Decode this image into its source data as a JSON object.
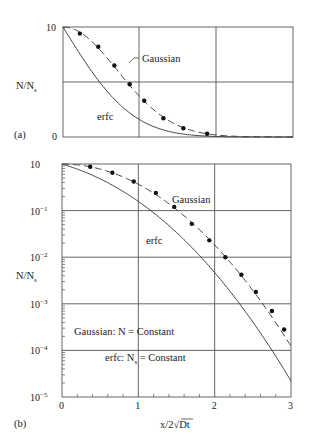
{
  "figure": {
    "panel_a_label": "(a)",
    "panel_b_label": "(b)"
  },
  "chart_data": [
    {
      "panel": "(a)",
      "type": "line",
      "scale": "linear",
      "xlabel": "",
      "ylabel": "N/N_s",
      "ylabel_main": "N/N",
      "ylabel_sub": "s",
      "ytick_labels": [
        "10",
        "0"
      ],
      "xlim": [
        0,
        3
      ],
      "ylim": [
        0,
        1
      ],
      "grid": true,
      "annotations": [
        "Gaussian",
        "erfc"
      ],
      "series": [
        {
          "name": "Gaussian",
          "style": "dashed with dots",
          "x": [
            0.22,
            0.46,
            0.67,
            0.87,
            1.06,
            1.31,
            1.57,
            1.88
          ],
          "values": [
            0.94,
            0.82,
            0.65,
            0.48,
            0.33,
            0.17,
            0.08,
            0.03
          ]
        },
        {
          "name": "erfc",
          "style": "solid",
          "x": [
            0,
            0.25,
            0.5,
            0.75,
            1.0,
            1.25,
            1.5,
            1.75,
            2.0,
            2.25,
            2.5,
            3.0
          ],
          "values": [
            1.0,
            0.72,
            0.48,
            0.29,
            0.16,
            0.077,
            0.034,
            0.013,
            0.005,
            0.0015,
            0.0004,
            0.0
          ]
        }
      ]
    },
    {
      "panel": "(b)",
      "type": "line",
      "scale": "log",
      "xlabel": "x/2√Dt",
      "xlabel_prefix": "x/2",
      "xlabel_root": "√",
      "xlabel_radicand": "Dt",
      "ylabel": "N/N_s",
      "ylabel_main": "N/N",
      "ylabel_sub": "s",
      "xtick_labels": [
        "0",
        "1",
        "2",
        "3"
      ],
      "ytick_labels": [
        "10",
        "10⁻¹",
        "10⁻²",
        "10⁻³",
        "10⁻⁴",
        "10⁻⁵"
      ],
      "ytick_mantissa": "10",
      "ytick_exponents": [
        "",
        "−1",
        "−2",
        "−3",
        "−4",
        "−5"
      ],
      "xlim": [
        0,
        3
      ],
      "ylim_log10": [
        -5,
        0
      ],
      "grid": true,
      "annotations": [
        "Gaussian",
        "erfc",
        "Gaussian: N = Constant",
        "erfc: N_s = Constant"
      ],
      "legend_text_1": "Gaussian: N = Constant",
      "legend_text_2_prefix": "erfc: N",
      "legend_text_2_sub": "s",
      "legend_text_2_suffix": " = Constant",
      "series": [
        {
          "name": "Gaussian",
          "style": "dashed with dots",
          "x": [
            0.37,
            0.66,
            0.94,
            1.23,
            1.47,
            1.7,
            1.93,
            2.14,
            2.35,
            2.54,
            2.75,
            2.91
          ],
          "values": [
            0.87,
            0.65,
            0.42,
            0.24,
            0.12,
            0.052,
            0.023,
            0.01,
            0.0042,
            0.0018,
            0.0007,
            0.00028
          ]
        },
        {
          "name": "erfc",
          "style": "solid",
          "x": [
            0,
            0.25,
            0.5,
            0.75,
            1.0,
            1.25,
            1.5,
            1.75,
            2.0,
            2.25,
            2.5,
            2.75,
            3.0
          ],
          "values": [
            1.0,
            0.72,
            0.48,
            0.29,
            0.16,
            0.077,
            0.034,
            0.013,
            0.0047,
            0.0015,
            0.00041,
            0.0001,
            2.2e-05
          ]
        }
      ]
    }
  ]
}
